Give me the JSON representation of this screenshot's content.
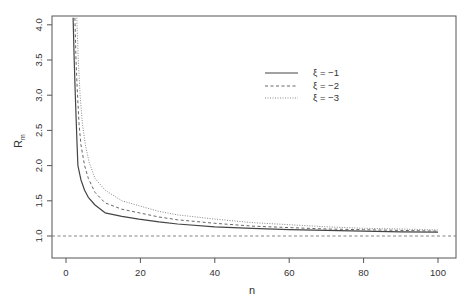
{
  "chart_data": {
    "type": "line",
    "title": "",
    "xlabel": "n",
    "ylabel": "R_m",
    "ylabel_main": "R",
    "ylabel_sub": "m",
    "xlim": [
      -3,
      105
    ],
    "ylim": [
      0.7,
      4.1
    ],
    "xticks": [
      0,
      20,
      40,
      60,
      80,
      100
    ],
    "yticks": [
      1.0,
      1.5,
      2.0,
      2.5,
      3.0,
      3.5,
      4.0
    ],
    "ytick_labels": [
      "1.0",
      "1.5",
      "2.0",
      "2.5",
      "3.0",
      "3.5",
      "4.0"
    ],
    "grid": false,
    "legend_position": "upper right (inside)",
    "reference_line": {
      "y": 1.0,
      "style": "dashed"
    },
    "series": [
      {
        "name": "ξ = −1",
        "style": "solid",
        "color": "#444444",
        "x": [
          1.9,
          2.2,
          2.5,
          2.9,
          3.2,
          4,
          5,
          6,
          7.8,
          10.5,
          15,
          19.6,
          25,
          30,
          40,
          50,
          60,
          70,
          80,
          90,
          100
        ],
        "y": [
          4.1,
          3.5,
          3.0,
          2.4,
          2.0,
          1.8,
          1.65,
          1.55,
          1.44,
          1.33,
          1.28,
          1.24,
          1.2,
          1.17,
          1.13,
          1.11,
          1.09,
          1.08,
          1.07,
          1.06,
          1.055
        ]
      },
      {
        "name": "ξ = −2",
        "style": "dashed",
        "color": "#666666",
        "x": [
          2.4,
          2.7,
          3.0,
          3.5,
          4.0,
          5,
          6,
          7.8,
          10.5,
          15,
          19.6,
          25,
          30,
          40,
          50,
          60,
          70,
          80,
          90,
          100
        ],
        "y": [
          4.1,
          3.5,
          3.1,
          2.6,
          2.3,
          2.0,
          1.82,
          1.62,
          1.47,
          1.38,
          1.33,
          1.27,
          1.23,
          1.18,
          1.14,
          1.12,
          1.1,
          1.09,
          1.08,
          1.07
        ]
      },
      {
        "name": "ξ = −3",
        "style": "dotted",
        "color": "#888888",
        "x": [
          2.9,
          3.3,
          3.8,
          4.4,
          5.2,
          6.2,
          7.8,
          10.5,
          15,
          19.6,
          25,
          30,
          40,
          50,
          60,
          70,
          80,
          90,
          100
        ],
        "y": [
          4.1,
          3.5,
          3.0,
          2.6,
          2.3,
          2.05,
          1.82,
          1.65,
          1.5,
          1.43,
          1.35,
          1.3,
          1.24,
          1.19,
          1.16,
          1.13,
          1.11,
          1.1,
          1.085
        ]
      }
    ]
  },
  "legend": {
    "items": [
      {
        "label": "ξ = −1",
        "style": "solid"
      },
      {
        "label": "ξ = −2",
        "style": "dashed"
      },
      {
        "label": "ξ = −3",
        "style": "dotted"
      }
    ]
  },
  "axes": {
    "x_label": "n",
    "y_label_main": "R",
    "y_label_sub": "m",
    "x_tick_labels": [
      "0",
      "20",
      "40",
      "60",
      "80",
      "100"
    ],
    "y_tick_labels": [
      "1.0",
      "1.5",
      "2.0",
      "2.5",
      "3.0",
      "3.5",
      "4.0"
    ]
  }
}
